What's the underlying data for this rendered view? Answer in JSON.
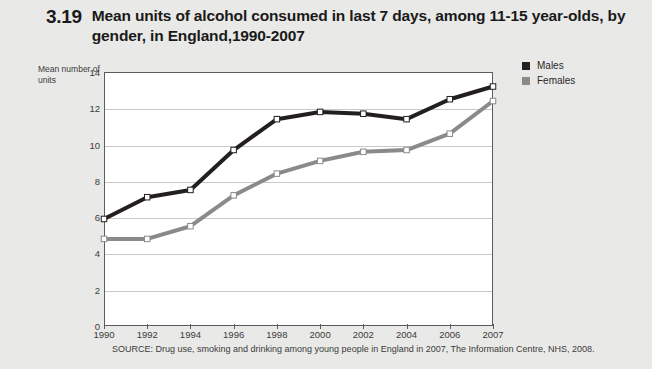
{
  "figure": {
    "number": "3.19",
    "title": "Mean units of alcohol consumed in last 7 days, among 11-15 year-olds, by gender, in England,1990-2007"
  },
  "source_note": "SOURCE: Drug use, smoking and drinking among young people in England in 2007, The Information Centre, NHS, 2008.",
  "legend": {
    "position": "top-right-outside",
    "entries": [
      {
        "label": "Males",
        "color": "#231f20"
      },
      {
        "label": "Females",
        "color": "#8a8a8a"
      }
    ]
  },
  "colors": {
    "males": "#231f20",
    "females": "#8a8a8a",
    "page_background": "#e9e9e7",
    "plot_background": "#ffffff",
    "axis": "#5c5c5c",
    "gridline": "#c9c9c9",
    "text": "#3b3b3b"
  },
  "chart_data": {
    "type": "line",
    "title": "Mean units of alcohol consumed in last 7 days, among 11-15 year-olds, by gender, in England,1990-2007",
    "xlabel": "",
    "ylabel": "Mean number of units",
    "categories": [
      "1990",
      "1992",
      "1994",
      "1996",
      "1998",
      "2000",
      "2002",
      "2004",
      "2006",
      "2007"
    ],
    "ylim": [
      0,
      14
    ],
    "yticks": [
      0,
      2,
      4,
      6,
      8,
      10,
      12,
      14
    ],
    "grid": true,
    "markers": "open-square",
    "series": [
      {
        "name": "Males",
        "color": "#231f20",
        "values": [
          5.9,
          7.1,
          7.5,
          9.7,
          11.4,
          11.8,
          11.7,
          11.4,
          12.5,
          13.2
        ]
      },
      {
        "name": "Females",
        "color": "#8a8a8a",
        "values": [
          4.8,
          4.8,
          5.5,
          7.2,
          8.4,
          9.1,
          9.6,
          9.7,
          10.6,
          12.4
        ]
      }
    ]
  }
}
